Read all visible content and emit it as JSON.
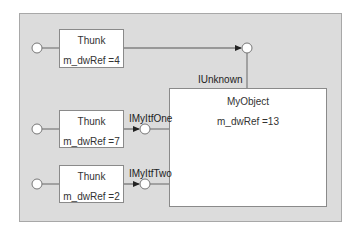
{
  "diagram": {
    "object": {
      "title": "MyObject",
      "ref": "m_dwRef =13"
    },
    "thunks": [
      {
        "title": "Thunk",
        "ref": "m_dwRef =4",
        "interface": "IUnknown"
      },
      {
        "title": "Thunk",
        "ref": "m_dwRef =7",
        "interface": "IMyItfOne"
      },
      {
        "title": "Thunk",
        "ref": "m_dwRef =2",
        "interface": "IMyItfTwo"
      }
    ],
    "colors": {
      "panel": "#dcdcdc",
      "box": "#ffffff",
      "line": "#555555"
    }
  }
}
